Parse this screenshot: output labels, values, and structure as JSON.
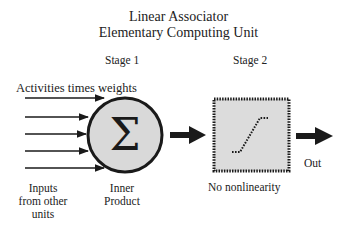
{
  "title": {
    "line1": "Linear Associator",
    "line2": "Elementary Computing Unit"
  },
  "stages": {
    "stage1": "Stage 1",
    "stage2": "Stage 2"
  },
  "labels": {
    "activities": "Activities times weights",
    "inputs": "Inputs from other units",
    "inner_product": "Inner Product",
    "no_nonlinearity": "No nonlinearity",
    "out": "Out"
  },
  "nodes": {
    "summation": {
      "symbol": "Σ",
      "fill": "#d9d9d9",
      "stroke": "#1a1a1a"
    },
    "linear_box": {
      "fill": "#dcdcdc",
      "border": "dotted",
      "stroke": "#1a1a1a"
    }
  },
  "input_arrows": 5,
  "colors": {
    "ink": "#1a1a1a",
    "background": "#ffffff"
  }
}
